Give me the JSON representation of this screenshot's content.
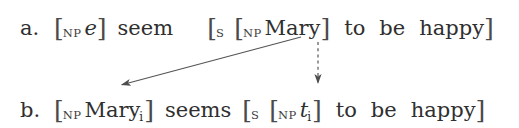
{
  "figure": {
    "kind": "syntactic-derivation",
    "background_color": "#ffffff",
    "text_color": "#2f2f2f"
  },
  "lines": [
    {
      "id": "a",
      "label": "a.",
      "plain_text": "a. [NP e] seem  [S [NP Mary] to be happy]",
      "tokens": {
        "bracket_open_1": "[",
        "cat_np_1": "NP",
        "empty_category": "e",
        "bracket_close_1": "]",
        "verb": "seem",
        "bracket_open_s": "[",
        "cat_s": "S",
        "bracket_open_2": "[",
        "cat_np_2": "NP",
        "subject": "Mary",
        "bracket_close_2": "]",
        "infinitive_to": "to",
        "copula": "be",
        "predicate": "happy",
        "bracket_close_s": "]"
      }
    },
    {
      "id": "b",
      "label": "b.",
      "plain_text": "b. [NP Maryi] seems [S [NP ti] to be happy]",
      "tokens": {
        "bracket_open_1": "[",
        "cat_np_1": "NP",
        "subject": "Mary",
        "subject_index": "i",
        "bracket_close_1": "]",
        "verb": "seems",
        "bracket_open_s": "[",
        "cat_s": "S",
        "bracket_open_2": "[",
        "cat_np_2": "NP",
        "trace": "t",
        "trace_index": "i",
        "bracket_close_2": "]",
        "infinitive_to": "to",
        "copula": "be",
        "predicate": "happy",
        "bracket_close_s": "]"
      }
    }
  ],
  "arrows": [
    {
      "name": "movement-arrow",
      "style": "solid",
      "color": "#555555",
      "from": {
        "x": 301,
        "y": 37
      },
      "to": {
        "x": 117,
        "y": 86
      },
      "meaning": "Mary raises from embedded subject to matrix subject position"
    },
    {
      "name": "trace-arrow",
      "style": "dashed",
      "color": "#555555",
      "from": {
        "x": 318,
        "y": 42
      },
      "to": {
        "x": 318,
        "y": 88
      },
      "meaning": "position vacated by Mary is occupied by trace t-sub-i"
    }
  ]
}
